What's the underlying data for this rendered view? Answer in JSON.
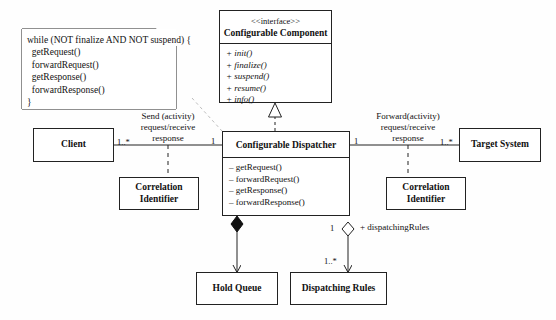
{
  "diagram": {
    "kind": "uml-class-diagram",
    "background": "#fefefe",
    "line_color": "#222222"
  },
  "note": {
    "name": "dispatcher-loop-note",
    "text": "while (NOT finalize AND NOT suspend) {\n  getRequest()\n  forwardRequest()\n  getResponse()\n  forwardResponse()\n}"
  },
  "interface_class": {
    "stereotype": "<<interface>>",
    "name": "Configurable Component",
    "operations": [
      "+ init()",
      "+ finalize()",
      "+ suspend()",
      "+ resume()",
      "+ info()"
    ]
  },
  "dispatcher_class": {
    "name": "Configurable Dispatcher",
    "operations": [
      "– getRequest()",
      "– forwardRequest()",
      "– getResponse()",
      "– forwardResponse()"
    ]
  },
  "classes": {
    "client": "Client",
    "target_system": "Target System",
    "correlation_identifier_left": "Correlation\nIdentifier",
    "correlation_identifier_right": "Correlation\nIdentifier",
    "hold_queue": "Hold Queue",
    "dispatching_rules": "Dispatching Rules"
  },
  "associations": {
    "client_to_dispatcher": {
      "label": "Send (activity)\nrequest/receive\nresponse",
      "source_multiplicity": "1..*",
      "target_multiplicity": "1"
    },
    "dispatcher_to_target": {
      "label": "Forward(activity)\nrequest/receive\nresponse",
      "source_multiplicity": "1",
      "target_multiplicity": "1..*"
    },
    "dispatcher_to_dispatching_rules": {
      "role": "+ dispatchingRules",
      "source_multiplicity": "1",
      "target_multiplicity": "1..*",
      "type": "aggregation"
    },
    "dispatcher_to_hold_queue": {
      "type": "composition"
    },
    "dispatcher_realizes_interface": {
      "type": "realization"
    }
  }
}
